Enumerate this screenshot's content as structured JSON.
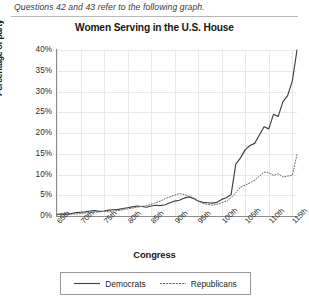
{
  "header": {
    "question_text": "Questions 42 and 43 refer to the following graph."
  },
  "chart_data": {
    "type": "line",
    "title": "Women Serving in the U.S. House",
    "xlabel": "Congress",
    "ylabel": "Percentage of party",
    "ylim": [
      0,
      40
    ],
    "ytick_labels": [
      "0%",
      "5%",
      "10%",
      "15%",
      "20%",
      "25%",
      "30%",
      "35%",
      "40%"
    ],
    "ytick_values": [
      0,
      5,
      10,
      15,
      20,
      25,
      30,
      35,
      40
    ],
    "xtick_labels": [
      "65th",
      "70th",
      "75th",
      "80th",
      "85th",
      "90th",
      "95th",
      "100th",
      "105th",
      "110th",
      "115th"
    ],
    "xtick_values": [
      65,
      70,
      75,
      80,
      85,
      90,
      95,
      100,
      105,
      110,
      115
    ],
    "xlim": [
      65,
      116
    ],
    "grid": true,
    "legend_position": "bottom",
    "x": [
      65,
      66,
      67,
      68,
      69,
      70,
      71,
      72,
      73,
      74,
      75,
      76,
      77,
      78,
      79,
      80,
      81,
      82,
      83,
      84,
      85,
      86,
      87,
      88,
      89,
      90,
      91,
      92,
      93,
      94,
      95,
      96,
      97,
      98,
      99,
      100,
      101,
      102,
      103,
      104,
      105,
      106,
      107,
      108,
      109,
      110,
      111,
      112,
      113,
      114,
      115,
      116
    ],
    "series": [
      {
        "name": "Democrats",
        "style": "solid",
        "color": "#3f3f3f",
        "values": [
          0.4,
          0.5,
          0.4,
          0.6,
          0.8,
          0.9,
          1.0,
          1.2,
          1.3,
          1.1,
          1.2,
          1.4,
          1.5,
          1.6,
          1.8,
          2.0,
          2.2,
          2.4,
          2.3,
          2.1,
          2.4,
          2.6,
          2.5,
          2.7,
          3.2,
          3.6,
          3.8,
          4.3,
          4.6,
          4.2,
          3.6,
          3.3,
          3.2,
          3.1,
          3.3,
          4.0,
          4.4,
          5.2,
          5.0,
          5.2,
          5.6,
          5.6,
          5.8,
          6.0,
          12.0,
          14.5,
          16.5,
          19.0,
          20.5,
          22.0,
          21.5,
          23.0
        ]
      },
      {
        "name": "Republicans",
        "style": "dotted",
        "color": "#6b6b6b",
        "values": [
          0.3,
          0.3,
          0.4,
          0.4,
          0.5,
          0.6,
          0.7,
          0.8,
          0.9,
          1.0,
          1.1,
          1.0,
          1.2,
          1.3,
          1.5,
          1.7,
          1.9,
          2.1,
          2.3,
          2.5,
          2.8,
          3.2,
          3.6,
          4.2,
          4.6,
          5.0,
          5.4,
          5.2,
          4.8,
          4.4,
          3.6,
          3.0,
          2.8,
          2.6,
          2.8,
          3.2,
          3.6,
          4.0,
          4.4,
          5.0,
          5.4,
          5.8,
          6.2,
          6.6,
          7.0,
          7.4,
          7.6,
          7.4,
          7.8,
          8.0,
          8.2,
          9.0
        ]
      }
    ],
    "series_extended": {
      "democrats_full": [
        0.4,
        0.5,
        0.4,
        0.6,
        0.8,
        0.9,
        1.0,
        1.2,
        1.3,
        1.1,
        1.2,
        1.4,
        1.5,
        1.6,
        1.8,
        2.0,
        2.2,
        2.4,
        2.3,
        2.1,
        2.4,
        2.6,
        2.5,
        2.7,
        3.2,
        3.6,
        3.8,
        4.3,
        4.6,
        4.2,
        3.6,
        3.3,
        3.2,
        3.1,
        3.3,
        4.0,
        4.4,
        5.2,
        12.5,
        14.0,
        16.0,
        17.0,
        17.5,
        19.5,
        21.5,
        21.0,
        24.5,
        24.0,
        27.5,
        29.0,
        32.5,
        40.0
      ],
      "republicans_full": [
        0.3,
        0.3,
        0.4,
        0.4,
        0.5,
        0.6,
        0.7,
        0.8,
        0.9,
        1.0,
        1.1,
        1.0,
        1.2,
        1.3,
        1.5,
        1.7,
        1.9,
        2.1,
        2.3,
        2.5,
        2.8,
        3.2,
        3.6,
        4.2,
        4.6,
        5.0,
        5.4,
        5.2,
        4.8,
        4.4,
        3.6,
        3.0,
        2.8,
        2.6,
        2.8,
        3.2,
        3.6,
        4.4,
        5.6,
        7.0,
        7.4,
        8.0,
        8.6,
        9.6,
        10.6,
        10.4,
        9.8,
        10.2,
        9.4,
        9.6,
        9.8,
        14.8
      ]
    },
    "legend": [
      {
        "label": "Democrats",
        "style": "solid"
      },
      {
        "label": "Republicans",
        "style": "dotted"
      }
    ]
  }
}
